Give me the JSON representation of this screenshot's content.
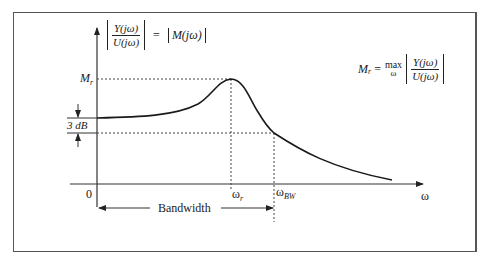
{
  "diagram": {
    "type": "frequency-response-magnitude",
    "y_axis_label": {
      "numerator": "Y(jω)",
      "denominator": "U(jω)",
      "equals": "=",
      "rhs": "M(jω)"
    },
    "x_axis_label": "ω",
    "origin_label": "0",
    "resonant_peak_label": {
      "main": "M",
      "sub": "r"
    },
    "three_db_label": "3 dB",
    "resonant_freq_label": {
      "main": "ω",
      "sub": "r"
    },
    "bandwidth_freq_label": {
      "main": "ω",
      "sub": "BW"
    },
    "bandwidth_label": "Bandwidth",
    "formula": {
      "lhs_main": "M",
      "lhs_sub": "r",
      "equals": "=",
      "operator": "max",
      "operator_sub": "ω",
      "numerator": "Y(jω)",
      "denominator": "U(jω)"
    },
    "colors": {
      "curve": "#1a1a1a",
      "axes": "#333333",
      "dashed": "#444444",
      "frame": "#555555"
    }
  }
}
